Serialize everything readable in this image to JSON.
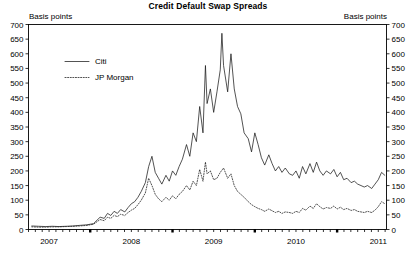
{
  "chart_data": {
    "type": "line",
    "title": "Credit Default Swap Spreads",
    "ylabel_left": "Basis points",
    "ylabel_right": "Basis points",
    "xlabel": "",
    "ylim": [
      0,
      700
    ],
    "ytick_step": 50,
    "yticks": [
      0,
      50,
      100,
      150,
      200,
      250,
      300,
      350,
      400,
      450,
      500,
      550,
      600,
      650,
      700
    ],
    "xlim": [
      2006.75,
      2011.1
    ],
    "xticks": [
      2007,
      2008,
      2009,
      2010,
      2011
    ],
    "xtick_labels": [
      "2007",
      "2008",
      "2009",
      "2010",
      "2011"
    ],
    "major_tick_x": [
      2007.5,
      2008.5,
      2009.5,
      2010.5
    ],
    "minor_tick_interval": 0.0833,
    "grid": false,
    "legend_position": "upper-left-inside",
    "series": [
      {
        "name": "Citi",
        "style": "solid",
        "color": "#1a1a1a",
        "x": [
          2006.79,
          2006.87,
          2006.96,
          2007.04,
          2007.12,
          2007.21,
          2007.29,
          2007.37,
          2007.46,
          2007.54,
          2007.62,
          2007.67,
          2007.71,
          2007.75,
          2007.79,
          2007.83,
          2007.87,
          2007.92,
          2007.96,
          2008.0,
          2008.04,
          2008.08,
          2008.12,
          2008.17,
          2008.21,
          2008.25,
          2008.29,
          2008.33,
          2008.37,
          2008.42,
          2008.46,
          2008.5,
          2008.54,
          2008.58,
          2008.62,
          2008.67,
          2008.71,
          2008.75,
          2008.79,
          2008.83,
          2008.87,
          2008.9,
          2008.92,
          2008.96,
          2009.0,
          2009.04,
          2009.08,
          2009.1,
          2009.12,
          2009.17,
          2009.21,
          2009.25,
          2009.29,
          2009.33,
          2009.37,
          2009.42,
          2009.46,
          2009.5,
          2009.54,
          2009.58,
          2009.62,
          2009.67,
          2009.71,
          2009.75,
          2009.79,
          2009.83,
          2009.87,
          2009.92,
          2009.96,
          2010.0,
          2010.04,
          2010.08,
          2010.12,
          2010.17,
          2010.21,
          2010.25,
          2010.29,
          2010.33,
          2010.37,
          2010.42,
          2010.46,
          2010.5,
          2010.54,
          2010.58,
          2010.62,
          2010.67,
          2010.71,
          2010.75,
          2010.79,
          2010.83,
          2010.87,
          2010.92,
          2010.96,
          2011.0,
          2011.04,
          2011.08
        ],
        "values": [
          12,
          11,
          10,
          11,
          10,
          11,
          12,
          14,
          16,
          20,
          42,
          38,
          55,
          48,
          62,
          55,
          68,
          60,
          75,
          88,
          95,
          110,
          130,
          160,
          215,
          250,
          195,
          175,
          155,
          185,
          165,
          200,
          185,
          215,
          240,
          290,
          250,
          330,
          300,
          420,
          330,
          560,
          430,
          480,
          400,
          470,
          545,
          670,
          560,
          470,
          600,
          480,
          420,
          395,
          330,
          310,
          265,
          330,
          290,
          245,
          220,
          255,
          225,
          200,
          215,
          195,
          210,
          190,
          185,
          200,
          175,
          215,
          190,
          225,
          195,
          230,
          200,
          185,
          200,
          190,
          205,
          180,
          195,
          170,
          175,
          160,
          165,
          155,
          150,
          145,
          150,
          140,
          155,
          170,
          195,
          185
        ]
      },
      {
        "name": "JP Morgan",
        "style": "dotted",
        "color": "#1a1a1a",
        "x": [
          2006.79,
          2006.87,
          2006.96,
          2007.04,
          2007.12,
          2007.21,
          2007.29,
          2007.37,
          2007.46,
          2007.54,
          2007.62,
          2007.67,
          2007.71,
          2007.75,
          2007.79,
          2007.83,
          2007.87,
          2007.92,
          2007.96,
          2008.0,
          2008.04,
          2008.08,
          2008.12,
          2008.17,
          2008.21,
          2008.25,
          2008.29,
          2008.33,
          2008.37,
          2008.42,
          2008.46,
          2008.5,
          2008.54,
          2008.58,
          2008.62,
          2008.67,
          2008.71,
          2008.75,
          2008.79,
          2008.83,
          2008.87,
          2008.9,
          2008.92,
          2008.96,
          2009.0,
          2009.04,
          2009.08,
          2009.12,
          2009.17,
          2009.21,
          2009.25,
          2009.29,
          2009.33,
          2009.37,
          2009.42,
          2009.46,
          2009.5,
          2009.54,
          2009.58,
          2009.62,
          2009.67,
          2009.71,
          2009.75,
          2009.79,
          2009.83,
          2009.87,
          2009.92,
          2009.96,
          2010.0,
          2010.04,
          2010.08,
          2010.12,
          2010.17,
          2010.21,
          2010.25,
          2010.29,
          2010.33,
          2010.37,
          2010.42,
          2010.46,
          2010.5,
          2010.54,
          2010.58,
          2010.62,
          2010.67,
          2010.71,
          2010.75,
          2010.79,
          2010.83,
          2010.87,
          2010.92,
          2010.96,
          2011.0,
          2011.04,
          2011.08
        ],
        "values": [
          9,
          8,
          8,
          9,
          9,
          10,
          11,
          12,
          14,
          18,
          34,
          30,
          42,
          38,
          48,
          44,
          52,
          48,
          58,
          66,
          72,
          85,
          100,
          125,
          175,
          150,
          120,
          105,
          95,
          110,
          100,
          115,
          105,
          120,
          130,
          150,
          135,
          165,
          150,
          205,
          165,
          230,
          190,
          200,
          170,
          175,
          195,
          210,
          175,
          190,
          150,
          130,
          120,
          110,
          95,
          85,
          78,
          72,
          68,
          62,
          70,
          64,
          58,
          62,
          55,
          60,
          58,
          55,
          62,
          58,
          72,
          66,
          80,
          72,
          88,
          78,
          70,
          75,
          72,
          80,
          70,
          76,
          68,
          72,
          65,
          68,
          62,
          60,
          58,
          62,
          58,
          66,
          78,
          95,
          88
        ]
      }
    ]
  }
}
